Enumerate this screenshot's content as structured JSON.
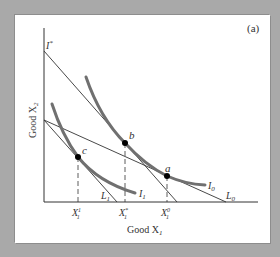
{
  "figure": {
    "panel_label": "(a)",
    "x_axis_label": "Good X",
    "x_axis_subscript": "1",
    "y_axis_label": "Good X",
    "y_axis_subscript": "2",
    "intercept_label": "I",
    "intercept_superscript": "*",
    "points": [
      {
        "id": "a",
        "label": "a"
      },
      {
        "id": "b",
        "label": "b"
      },
      {
        "id": "c",
        "label": "c"
      }
    ],
    "curves": [
      {
        "id": "I0",
        "label": "I",
        "subscript": "0"
      },
      {
        "id": "I1",
        "label": "I",
        "subscript": "1"
      }
    ],
    "lines": [
      {
        "id": "L0",
        "label": "L",
        "subscript": "0"
      },
      {
        "id": "L1",
        "label": "L",
        "subscript": "1"
      },
      {
        "id": "Lstar",
        "label": "",
        "subscript": ""
      }
    ],
    "x_ticks": [
      {
        "label": "X",
        "sub": "1",
        "sup": "1"
      },
      {
        "label": "X",
        "sub": "1",
        "sup": "*"
      },
      {
        "label": "X",
        "sub": "1",
        "sup": "0"
      }
    ]
  },
  "colors": {
    "background": "#a9a9a9",
    "panel": "#ffffff",
    "axis": "#333333",
    "budget_line": "#333333",
    "indifference_curve": "#707070",
    "point": "#000000"
  }
}
